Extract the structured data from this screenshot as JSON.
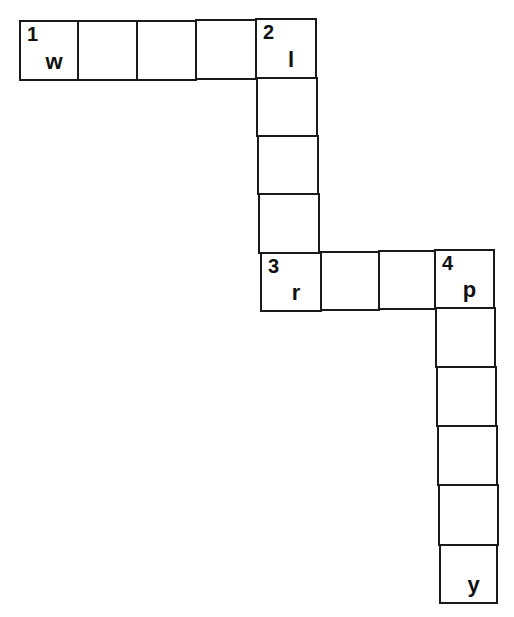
{
  "puzzle": {
    "type": "crossword",
    "cells": [
      {
        "x": 19,
        "y": 20,
        "w": 60,
        "h": 61,
        "number": "1",
        "letter": "w"
      },
      {
        "x": 77,
        "y": 20,
        "w": 61,
        "h": 61,
        "number": "",
        "letter": ""
      },
      {
        "x": 136,
        "y": 20,
        "w": 61,
        "h": 61,
        "number": "",
        "letter": ""
      },
      {
        "x": 195,
        "y": 19,
        "w": 62,
        "h": 61,
        "number": "",
        "letter": ""
      },
      {
        "x": 255,
        "y": 18,
        "w": 62,
        "h": 61,
        "number": "2",
        "letter": "l"
      },
      {
        "x": 256,
        "y": 77,
        "w": 62,
        "h": 60,
        "number": "",
        "letter": ""
      },
      {
        "x": 257,
        "y": 135,
        "w": 62,
        "h": 60,
        "number": "",
        "letter": ""
      },
      {
        "x": 258,
        "y": 193,
        "w": 62,
        "h": 61,
        "number": "",
        "letter": ""
      },
      {
        "x": 260,
        "y": 252,
        "w": 62,
        "h": 60,
        "number": "3",
        "letter": "r"
      },
      {
        "x": 320,
        "y": 251,
        "w": 60,
        "h": 60,
        "number": "",
        "letter": ""
      },
      {
        "x": 378,
        "y": 250,
        "w": 58,
        "h": 60,
        "number": "",
        "letter": ""
      },
      {
        "x": 434,
        "y": 249,
        "w": 61,
        "h": 60,
        "number": "4",
        "letter": "p"
      },
      {
        "x": 435,
        "y": 307,
        "w": 61,
        "h": 61,
        "number": "",
        "letter": ""
      },
      {
        "x": 436,
        "y": 366,
        "w": 61,
        "h": 61,
        "number": "",
        "letter": ""
      },
      {
        "x": 437,
        "y": 425,
        "w": 61,
        "h": 61,
        "number": "",
        "letter": ""
      },
      {
        "x": 438,
        "y": 484,
        "w": 61,
        "h": 62,
        "number": "",
        "letter": ""
      },
      {
        "x": 439,
        "y": 544,
        "w": 59,
        "h": 60,
        "number": "",
        "letter": "y"
      }
    ]
  }
}
